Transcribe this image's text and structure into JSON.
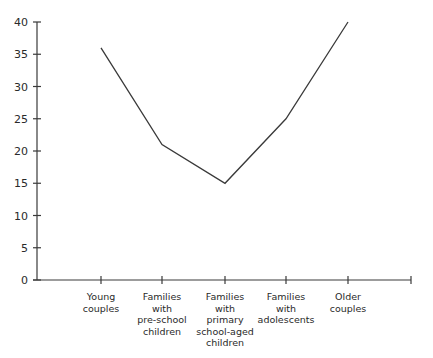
{
  "chart_data": {
    "type": "line",
    "title": "",
    "xlabel": "",
    "ylabel": "",
    "categories": [
      "Young couples",
      "Families with pre-school children",
      "Families with primary school-aged children",
      "Families with adolescents",
      "Older couples"
    ],
    "category_lines": [
      [
        "Young",
        "couples"
      ],
      [
        "Families",
        "with",
        "pre-school",
        "children"
      ],
      [
        "Families",
        "with",
        "primary",
        "school-aged",
        "children"
      ],
      [
        "Families",
        "with",
        "adolescents"
      ],
      [
        "Older",
        "couples"
      ]
    ],
    "values": [
      36,
      21,
      15,
      25,
      40
    ],
    "ylim": [
      0,
      40
    ],
    "yticks": [
      0,
      5,
      10,
      15,
      20,
      25,
      30,
      35,
      40
    ],
    "grid": false,
    "legend": null,
    "line_color": "#3a3a3a"
  }
}
